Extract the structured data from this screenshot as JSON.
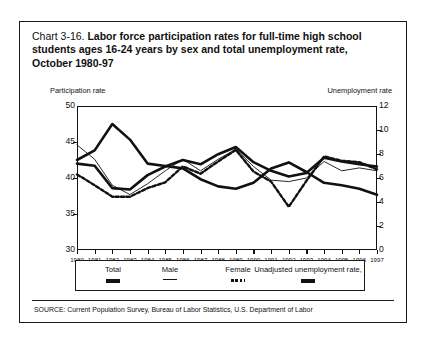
{
  "title": {
    "number": "Chart 3-16.",
    "text": "Labor force participation rates for full-time high school students ages 16-24 years by sex and total unemployment rate, October 1980-97"
  },
  "left_axis_caption": "Participation rate",
  "right_axis_caption": "Unemployment rate",
  "source": "SOURCE: Current Population Survey, Bureau of Labor Statistics, U.S. Department of Labor",
  "legend": [
    {
      "label": "Total",
      "style": "thick"
    },
    {
      "label": "Male",
      "style": "thin"
    },
    {
      "label": "Female",
      "style": "dotted"
    },
    {
      "label": "Unadjusted unemployment rate,",
      "style": "thick"
    }
  ],
  "chart_data": {
    "type": "line",
    "title": "Chart 3-16. Labor force participation rates for full-time high school students ages 16-24 years by sex and total unemployment rate, October 1980-97",
    "xlabel": "",
    "ylabel": "Participation rate",
    "y2label": "Unemployment rate",
    "grid": false,
    "legend_position": "bottom",
    "x": [
      1980,
      1981,
      1982,
      1983,
      1984,
      1985,
      1986,
      1987,
      1988,
      1989,
      1990,
      1991,
      1992,
      1993,
      1994,
      1995,
      1996,
      1997
    ],
    "xticklabels": [
      "1980",
      "1981",
      "1982",
      "1983",
      "1984",
      "1985",
      "1986",
      "1987",
      "1988",
      "1989",
      "1990",
      "1991",
      "1992",
      "1993",
      "1994",
      "1995",
      "1996",
      "1997"
    ],
    "ylim": [
      30,
      50
    ],
    "yticks": [
      30,
      35,
      40,
      45,
      50
    ],
    "y2lim": [
      0,
      12
    ],
    "y2ticks": [
      0,
      2,
      4,
      6,
      8,
      10,
      12
    ],
    "series": [
      {
        "name": "Total",
        "axis": "left",
        "style": "thick",
        "values": [
          42.0,
          41.7,
          38.6,
          38.4,
          40.4,
          41.6,
          42.5,
          41.9,
          43.3,
          44.3,
          42.2,
          41.0,
          40.2,
          40.7,
          42.8,
          42.3,
          41.9,
          41.6
        ]
      },
      {
        "name": "Male",
        "axis": "left",
        "style": "thin",
        "values": [
          44.6,
          42.6,
          39.0,
          37.7,
          39.2,
          41.0,
          42.6,
          41.0,
          42.6,
          44.0,
          41.6,
          39.7,
          39.5,
          40.0,
          42.3,
          41.0,
          41.4,
          41.0
        ]
      },
      {
        "name": "Female",
        "axis": "left",
        "style": "dotted",
        "values": [
          40.5,
          39.0,
          37.4,
          37.4,
          38.6,
          39.4,
          41.6,
          40.6,
          42.3,
          43.9,
          40.9,
          39.5,
          36.0,
          39.6,
          43.0,
          42.4,
          42.2,
          41.2
        ]
      },
      {
        "name": "Unadjusted unemployment rate",
        "axis": "right",
        "style": "thick",
        "values": [
          7.5,
          8.3,
          10.5,
          9.2,
          7.2,
          7.0,
          6.8,
          5.9,
          5.3,
          5.1,
          5.6,
          6.8,
          7.3,
          6.5,
          5.6,
          5.4,
          5.1,
          4.6
        ]
      }
    ]
  }
}
